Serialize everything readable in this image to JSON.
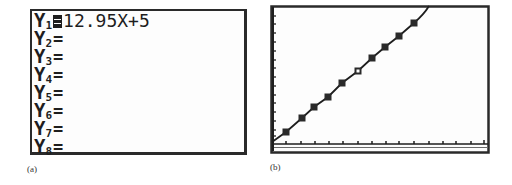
{
  "panel_a": {
    "caption": "(a)",
    "rows": [
      {
        "letter": "Y",
        "sub": "1",
        "selected": true,
        "eq": "",
        "expr": "12.95X+5"
      },
      {
        "letter": "Y",
        "sub": "2",
        "selected": false,
        "eq": "=",
        "expr": ""
      },
      {
        "letter": "Y",
        "sub": "3",
        "selected": false,
        "eq": "=",
        "expr": ""
      },
      {
        "letter": "Y",
        "sub": "4",
        "selected": false,
        "eq": "=",
        "expr": ""
      },
      {
        "letter": "Y",
        "sub": "5",
        "selected": false,
        "eq": "=",
        "expr": ""
      },
      {
        "letter": "Y",
        "sub": "6",
        "selected": false,
        "eq": "=",
        "expr": ""
      },
      {
        "letter": "Y",
        "sub": "7",
        "selected": false,
        "eq": "=",
        "expr": ""
      },
      {
        "letter": "Y",
        "sub": "8",
        "selected": false,
        "eq": "=",
        "expr": ""
      }
    ]
  },
  "panel_b": {
    "caption": "(b)",
    "function": "Y1=12.95X+5",
    "x_tick_count": 15,
    "y_tick_count": 16,
    "marker_count": 10,
    "open_marker_index": 5,
    "colors": {
      "line": "#1e1e1e",
      "frame": "#2a2a2a"
    }
  }
}
